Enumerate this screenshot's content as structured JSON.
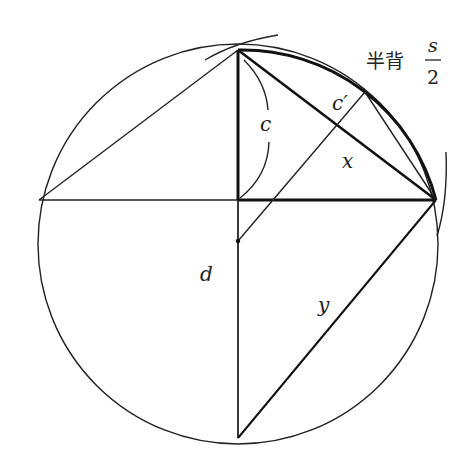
{
  "diagram": {
    "title_label": "半背",
    "fraction": {
      "numerator": "s",
      "denominator": "2"
    },
    "labels": {
      "c": "c",
      "c_prime": "c′",
      "x": "x",
      "d": "d",
      "y": "y"
    }
  }
}
